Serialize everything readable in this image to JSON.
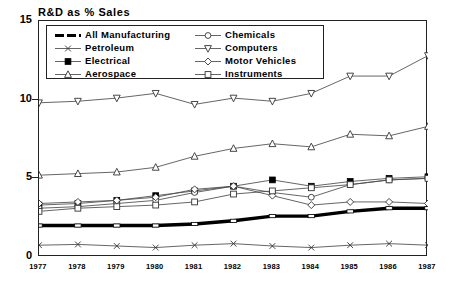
{
  "chart_data": {
    "type": "line",
    "title": "R&D as % Sales",
    "xlabel": "",
    "ylabel": "",
    "x": [
      1977,
      1978,
      1979,
      1980,
      1981,
      1982,
      1983,
      1984,
      1985,
      1986,
      1987
    ],
    "xtick_labels": [
      "1977",
      "1978",
      "1979",
      "1980",
      "1981",
      "1982",
      "1983",
      "1984",
      "1985",
      "1986",
      "1987"
    ],
    "ytick_labels": [
      "0",
      "5",
      "10",
      "15"
    ],
    "yticks": [
      0,
      5,
      10,
      15
    ],
    "ylim": [
      0,
      15
    ],
    "xlim": [
      1977,
      1987
    ],
    "grid": false,
    "legend_position": "upper-left-inside",
    "series": [
      {
        "name": "All Manufacturing",
        "marker": "thick-dash",
        "values": [
          2.0,
          2.0,
          2.0,
          2.0,
          2.1,
          2.3,
          2.6,
          2.6,
          2.9,
          3.1,
          3.1
        ]
      },
      {
        "name": "Petroleum",
        "marker": "x",
        "values": [
          0.75,
          0.8,
          0.7,
          0.6,
          0.75,
          0.85,
          0.7,
          0.6,
          0.75,
          0.85,
          0.75
        ]
      },
      {
        "name": "Electrical",
        "marker": "filled-square",
        "values": [
          3.3,
          3.4,
          3.6,
          3.9,
          4.2,
          4.5,
          4.9,
          4.5,
          4.8,
          5.0,
          5.1
        ]
      },
      {
        "name": "Aerospace",
        "marker": "triangle",
        "values": [
          5.2,
          5.3,
          5.4,
          5.7,
          6.4,
          6.9,
          7.2,
          7.0,
          7.8,
          7.7,
          8.3
        ]
      },
      {
        "name": "Chemicals",
        "marker": "circle",
        "values": [
          3.1,
          3.2,
          3.4,
          3.6,
          4.1,
          4.5,
          4.1,
          3.8,
          4.6,
          4.9,
          5.0
        ]
      },
      {
        "name": "Computers",
        "marker": "down-triangle",
        "values": [
          9.8,
          9.9,
          10.1,
          10.4,
          9.7,
          10.1,
          9.9,
          10.4,
          11.5,
          11.5,
          12.8
        ]
      },
      {
        "name": "Motor Vehicles",
        "marker": "diamond",
        "values": [
          3.4,
          3.5,
          3.6,
          3.8,
          4.3,
          4.5,
          3.9,
          3.3,
          3.5,
          3.5,
          3.4
        ]
      },
      {
        "name": "Instruments",
        "marker": "open-square",
        "values": [
          2.9,
          3.1,
          3.2,
          3.3,
          3.5,
          4.0,
          4.2,
          4.4,
          4.6,
          4.9,
          5.0
        ]
      }
    ]
  },
  "legend": {
    "entries": [
      {
        "label": "All Manufacturing"
      },
      {
        "label": "Petroleum"
      },
      {
        "label": "Electrical"
      },
      {
        "label": "Aerospace"
      },
      {
        "label": "Chemicals"
      },
      {
        "label": "Computers"
      },
      {
        "label": "Motor Vehicles"
      },
      {
        "label": "Instruments"
      }
    ]
  },
  "colors": {
    "axis": "#222222",
    "line": "#555555",
    "emphasis": "#000000",
    "background": "#ffffff"
  }
}
